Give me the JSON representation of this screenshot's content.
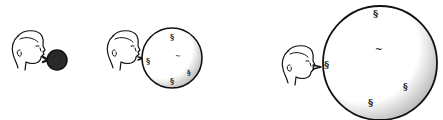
{
  "illustration": {
    "description": "Three-panel line drawing: a boy blowing up a balloon dotted with spiral galaxy marks, balloon growing larger in each panel (expanding universe analogy)",
    "colors": {
      "ink": "#111111",
      "background": "#ffffff",
      "small_balloon_fill": "#2a2a2a"
    },
    "panels": [
      {
        "id": "panel-1",
        "balloon_size": "small",
        "balloon_cx": 57,
        "balloon_cy": 60,
        "balloon_r": 10,
        "galaxy_symbol": "spiral-galaxy-icon",
        "galaxy_count": 3
      },
      {
        "id": "panel-2",
        "balloon_size": "medium",
        "balloon_cx": 172,
        "balloon_cy": 58,
        "balloon_r": 30,
        "galaxy_symbol": "spiral-galaxy-icon",
        "galaxy_count": 5
      },
      {
        "id": "panel-3",
        "balloon_size": "large",
        "balloon_cx": 380,
        "balloon_cy": 63,
        "balloon_r": 57,
        "galaxy_symbol": "spiral-galaxy-icon",
        "galaxy_count": 5
      }
    ]
  }
}
